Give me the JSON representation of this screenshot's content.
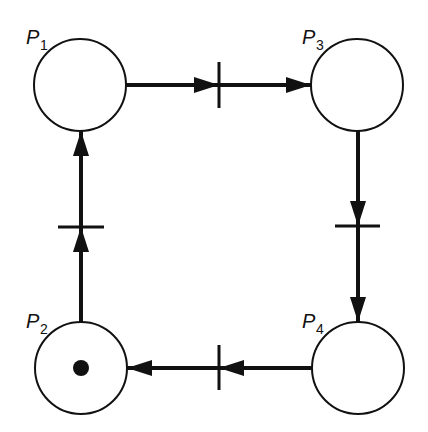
{
  "diagram": {
    "type": "petri-net",
    "places": [
      {
        "id": "P1",
        "label": "P",
        "sub": "1",
        "cx": 80,
        "cy": 85,
        "tokens": 0
      },
      {
        "id": "P3",
        "label": "P",
        "sub": "3",
        "cx": 357,
        "cy": 85,
        "tokens": 0
      },
      {
        "id": "P2",
        "label": "P",
        "sub": "2",
        "cx": 81,
        "cy": 368,
        "tokens": 1
      },
      {
        "id": "P4",
        "label": "P",
        "sub": "4",
        "cx": 358,
        "cy": 368,
        "tokens": 0
      }
    ],
    "transitions": [
      {
        "id": "T1",
        "from": "P1",
        "to": "P3",
        "orientation": "vertical"
      },
      {
        "id": "T2",
        "from": "P3",
        "to": "P4",
        "orientation": "horizontal"
      },
      {
        "id": "T3",
        "from": "P4",
        "to": "P2",
        "orientation": "vertical"
      },
      {
        "id": "T4",
        "from": "P2",
        "to": "P1",
        "orientation": "horizontal"
      }
    ],
    "labels": {
      "p1": "P",
      "p1_sub": "1",
      "p2": "P",
      "p2_sub": "2",
      "p3": "P",
      "p3_sub": "3",
      "p4": "P",
      "p4_sub": "4"
    }
  }
}
